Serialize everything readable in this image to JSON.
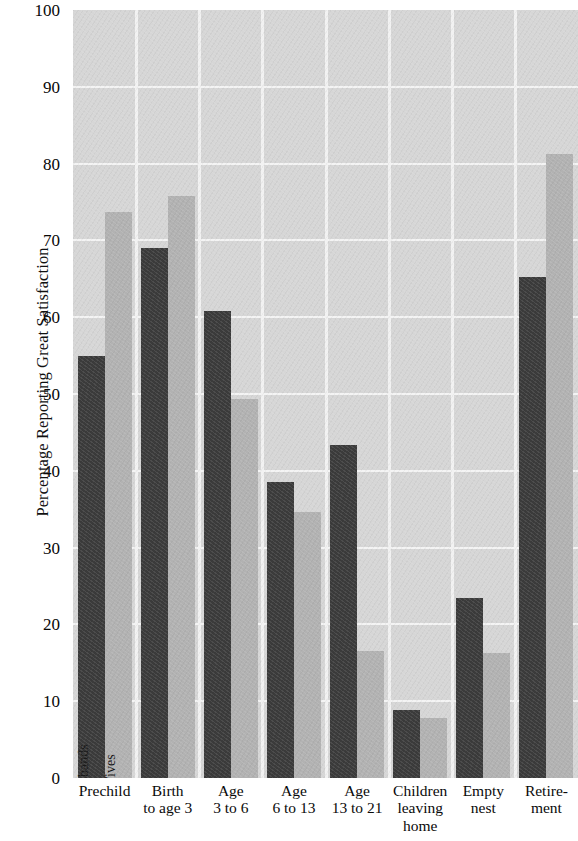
{
  "chart_data": {
    "type": "bar",
    "title": "",
    "subtitle": "",
    "xlabel": "",
    "ylabel": "Percentage Reporting Great Satisfaction",
    "ylim": [
      0,
      100
    ],
    "ytick_step": 10,
    "yticks": [
      0,
      10,
      20,
      30,
      40,
      50,
      60,
      70,
      80,
      90,
      100
    ],
    "grid": "horizontal-and-vertical",
    "legend_position": "in-bar (first group, rotated labels)",
    "categories": [
      "Prechild",
      "Birth to age 3",
      "Age 3 to 6",
      "Age 6 to 13",
      "Age 13 to 21",
      "Children leaving home",
      "Empty nest",
      "Retirement"
    ],
    "category_lines": [
      [
        "Prechild"
      ],
      [
        "Birth",
        "to age 3"
      ],
      [
        "Age",
        "3 to 6"
      ],
      [
        "Age",
        "6 to 13"
      ],
      [
        "Age",
        "13 to 21"
      ],
      [
        "Children",
        "leaving",
        "home"
      ],
      [
        "Empty",
        "nest"
      ],
      [
        "Retire-",
        "ment"
      ]
    ],
    "series": [
      {
        "name": "Husbands",
        "color": "#3b3b3b",
        "values": [
          55.0,
          69.0,
          60.8,
          38.5,
          43.3,
          8.8,
          23.5,
          65.3
        ]
      },
      {
        "name": "Wives",
        "color": "#b2b2b2",
        "values": [
          73.7,
          75.8,
          49.4,
          34.6,
          16.5,
          7.8,
          16.3,
          81.3
        ]
      }
    ]
  },
  "colors": {
    "plot_background": "#d6d6d6",
    "gridline": "#f4f4f4",
    "husbands_bar": "#3b3b3b",
    "wives_bar": "#b2b2b2",
    "page_background": "#ffffff",
    "text": "#0a0a0a"
  }
}
